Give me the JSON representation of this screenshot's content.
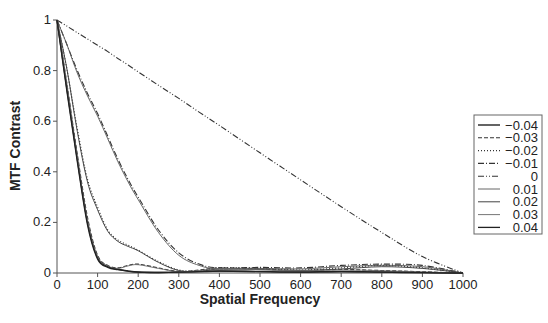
{
  "chart_data": {
    "type": "line",
    "title": "",
    "xlabel": "Spatial Frequency",
    "ylabel": "MTF Contrast",
    "xlim": [
      0,
      1000
    ],
    "ylim": [
      0,
      1
    ],
    "xticks": [
      "0",
      "100",
      "200",
      "300",
      "400",
      "500",
      "600",
      "700",
      "800",
      "900",
      "1000"
    ],
    "yticks": [
      "0",
      "0.2",
      "0.4",
      "0.6",
      "0.8",
      "1"
    ],
    "grid": false,
    "legend_position": "right",
    "x": [
      0,
      25,
      50,
      75,
      100,
      125,
      150,
      175,
      200,
      250,
      300,
      350,
      400,
      500,
      600,
      700,
      800,
      900,
      1000
    ],
    "series": [
      {
        "name": "−0.04",
        "style": "solid",
        "values": [
          1,
          0.72,
          0.45,
          0.2,
          0.06,
          0.025,
          0.015,
          0.008,
          0.004,
          0.002,
          0.004,
          0.006,
          0.008,
          0.006,
          0.004,
          0.006,
          0.004,
          0.002,
          0
        ]
      },
      {
        "name": "−0.03",
        "style": "dashed",
        "values": [
          1,
          0.74,
          0.47,
          0.22,
          0.07,
          0.03,
          0.02,
          0.03,
          0.035,
          0.02,
          0.006,
          0.012,
          0.02,
          0.015,
          0.01,
          0.014,
          0.01,
          0.005,
          0
        ]
      },
      {
        "name": "−0.02",
        "style": "dotted",
        "values": [
          1,
          0.8,
          0.57,
          0.37,
          0.26,
          0.17,
          0.13,
          0.11,
          0.09,
          0.045,
          0.012,
          0.008,
          0.02,
          0.018,
          0.012,
          0.02,
          0.03,
          0.02,
          0
        ]
      },
      {
        "name": "−0.01",
        "style": "dashdot",
        "values": [
          1,
          0.9,
          0.8,
          0.71,
          0.63,
          0.54,
          0.45,
          0.37,
          0.3,
          0.17,
          0.08,
          0.035,
          0.02,
          0.022,
          0.02,
          0.03,
          0.035,
          0.03,
          0
        ]
      },
      {
        "name": "0",
        "style": "dashdotdot",
        "values": [
          1,
          0.975,
          0.95,
          0.925,
          0.9,
          0.875,
          0.848,
          0.822,
          0.795,
          0.742,
          0.69,
          0.636,
          0.583,
          0.475,
          0.368,
          0.262,
          0.16,
          0.065,
          0
        ]
      },
      {
        "name": "0.01",
        "style": "solid",
        "values": [
          1,
          0.9,
          0.79,
          0.7,
          0.62,
          0.53,
          0.44,
          0.36,
          0.29,
          0.16,
          0.07,
          0.03,
          0.015,
          0.018,
          0.016,
          0.025,
          0.03,
          0.025,
          0
        ]
      },
      {
        "name": "0.02",
        "style": "solid",
        "values": [
          1,
          0.8,
          0.56,
          0.36,
          0.25,
          0.165,
          0.125,
          0.105,
          0.088,
          0.042,
          0.01,
          0.006,
          0.016,
          0.014,
          0.01,
          0.016,
          0.025,
          0.018,
          0
        ]
      },
      {
        "name": "0.03",
        "style": "solid",
        "values": [
          1,
          0.74,
          0.46,
          0.21,
          0.065,
          0.028,
          0.018,
          0.028,
          0.033,
          0.018,
          0.005,
          0.01,
          0.018,
          0.013,
          0.009,
          0.012,
          0.009,
          0.004,
          0
        ]
      },
      {
        "name": "0.04",
        "style": "solid",
        "values": [
          1,
          0.71,
          0.44,
          0.19,
          0.055,
          0.022,
          0.013,
          0.007,
          0.003,
          0.002,
          0.003,
          0.005,
          0.007,
          0.005,
          0.003,
          0.005,
          0.003,
          0.001,
          0
        ]
      }
    ]
  }
}
